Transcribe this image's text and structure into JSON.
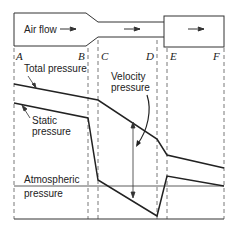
{
  "duct": {
    "airflow_label": "Air flow"
  },
  "sections": [
    "A",
    "B",
    "C",
    "D",
    "E",
    "F"
  ],
  "labels": {
    "total_pressure": "Total pressure",
    "static_pressure_1": "Static",
    "static_pressure_2": "pressure",
    "velocity_pressure_1": "Velocity",
    "velocity_pressure_2": "pressure",
    "atmospheric_1": "Atmospheric",
    "atmospheric_2": "pressure"
  },
  "colors": {
    "line": "#222222",
    "dash": "#444444"
  }
}
